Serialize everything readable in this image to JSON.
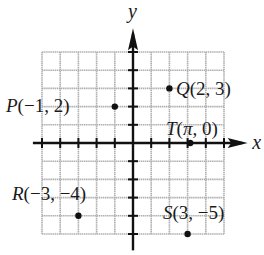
{
  "diagram": {
    "type": "coordinate-plane",
    "axes": {
      "x_label": "x",
      "y_label": "y"
    },
    "grid": {
      "x_min": -5,
      "x_max": 5,
      "y_min": -5,
      "y_max": 5,
      "step": 1
    },
    "points": [
      {
        "name": "P",
        "x": -1,
        "y": 2,
        "label": "P(−1, 2)",
        "label_side": "left"
      },
      {
        "name": "Q",
        "x": 2,
        "y": 3,
        "label": "Q(2, 3)",
        "label_side": "right"
      },
      {
        "name": "T",
        "x": 3.14159,
        "y": 0,
        "label": "T(π, 0)",
        "label_side": "above"
      },
      {
        "name": "R",
        "x": -3,
        "y": -4,
        "label": "R(−3, −4)",
        "label_side": "above-left"
      },
      {
        "name": "S",
        "x": 3,
        "y": -5,
        "label": "S(3, −5)",
        "label_side": "above"
      }
    ],
    "colors": {
      "grid": "#b0b0b0",
      "axis": "#111111",
      "point": "#111111",
      "text": "#1a1a1a"
    }
  }
}
